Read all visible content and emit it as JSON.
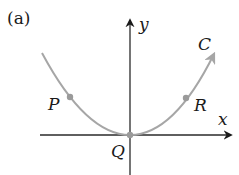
{
  "figure": {
    "panel_label": "(a)",
    "axes": {
      "x_label": "x",
      "y_label": "y"
    },
    "curve": {
      "label": "C",
      "color": "#a6a6a6"
    },
    "points": [
      {
        "label": "P"
      },
      {
        "label": "Q"
      },
      {
        "label": "R"
      }
    ],
    "point_color": "#9a9a9a",
    "axis_color": "#2a2a2a"
  }
}
